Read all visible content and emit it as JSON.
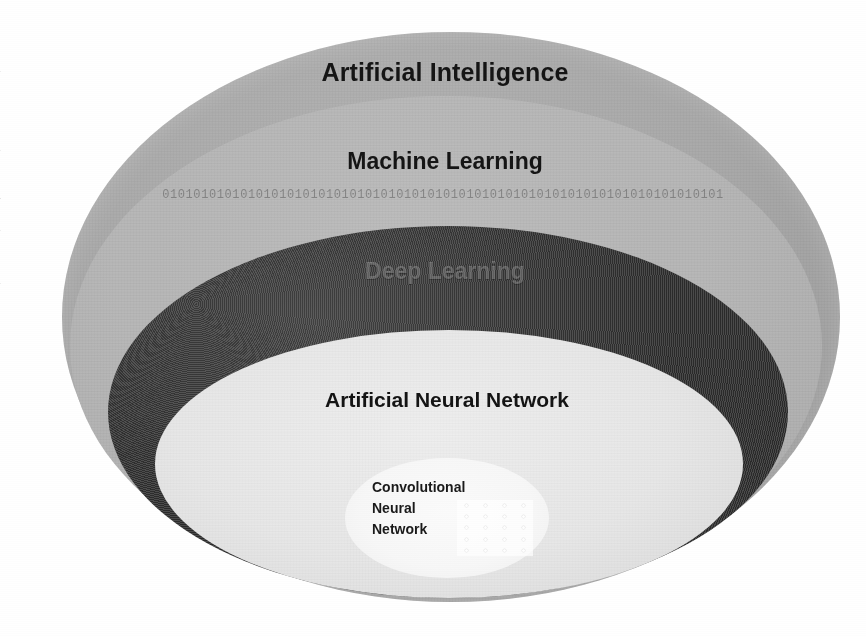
{
  "figure": {
    "type": "nested-ellipse-hierarchy",
    "caption_fragments_left_margin": [
      "t",
      "n",
      "-",
      "e",
      "n",
      "s",
      "y",
      "n",
      "-",
      "n",
      "f",
      "-",
      "-",
      "f"
    ],
    "layers": [
      {
        "id": "ai",
        "label": "Artificial Intelligence",
        "level": 1,
        "fill": "#a9a9a9",
        "text_color": "#151515"
      },
      {
        "id": "ml",
        "label": "Machine Learning",
        "level": 2,
        "fill": "#b6b6b6",
        "text_color": "#151515"
      },
      {
        "id": "dl",
        "label": "Deep Learning",
        "level": 3,
        "fill": "#3a3a3a",
        "text_color": "#c8c8c8"
      },
      {
        "id": "ann",
        "label": "Artificial Neural Network",
        "level": 4,
        "fill": "#e7e7e7",
        "text_color": "#141414"
      },
      {
        "id": "cnn",
        "label": "Convolutional Neural Network",
        "level": 5,
        "fill": "#f7f7f7",
        "text_color": "#1a1a1a",
        "label_lines": [
          "Convolutional",
          "Neural",
          "Network"
        ]
      }
    ],
    "binary_strip": "010101010101010101010101010101010101010101010101010101010101010101010101",
    "cnn_network_graphic": {
      "name": "neural-network-node-grid",
      "columns": 4,
      "rows": 5,
      "dot_color": "#ffffff"
    }
  },
  "chart_data": {
    "type": "pie",
    "categories": [
      "Artificial Intelligence",
      "Machine Learning",
      "Deep Learning",
      "Artificial Neural Network",
      "Convolutional Neural Network"
    ],
    "values": [
      5,
      4,
      3,
      2,
      1
    ],
    "xlabel": "",
    "ylabel": "",
    "legend_position": "none",
    "grid": false
  }
}
